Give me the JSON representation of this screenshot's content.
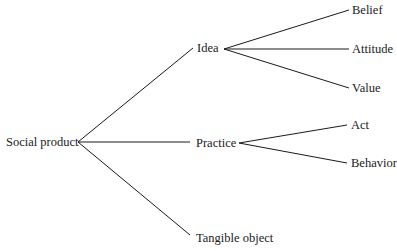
{
  "diagram": {
    "root": {
      "label": "Social product",
      "x": 6,
      "y": 142,
      "apex": [
        78,
        142
      ]
    },
    "branches": [
      {
        "label": "Idea",
        "x": 197,
        "y": 48,
        "line_end": [
          193,
          48
        ],
        "apex": [
          224,
          49
        ],
        "children": [
          {
            "label": "Belief",
            "x": 352,
            "y": 10,
            "line_end": [
              349,
              10
            ]
          },
          {
            "label": "Attitude",
            "x": 352,
            "y": 49,
            "line_end": [
              349,
              49
            ]
          },
          {
            "label": "Value",
            "x": 352,
            "y": 88,
            "line_end": [
              349,
              88
            ]
          }
        ]
      },
      {
        "label": "Practice",
        "x": 196,
        "y": 142,
        "line_end": [
          190,
          142
        ],
        "apex": [
          239,
          143
        ],
        "children": [
          {
            "label": "Act",
            "x": 351,
            "y": 125,
            "line_end": [
              347,
              125
            ]
          },
          {
            "label": "Behavior",
            "x": 351,
            "y": 163,
            "line_end": [
              347,
              163
            ]
          }
        ]
      },
      {
        "label": "Tangible object",
        "x": 196,
        "y": 238,
        "line_end": [
          190,
          235
        ],
        "apex": null,
        "children": []
      }
    ],
    "line_color": "#1a1a1a"
  }
}
